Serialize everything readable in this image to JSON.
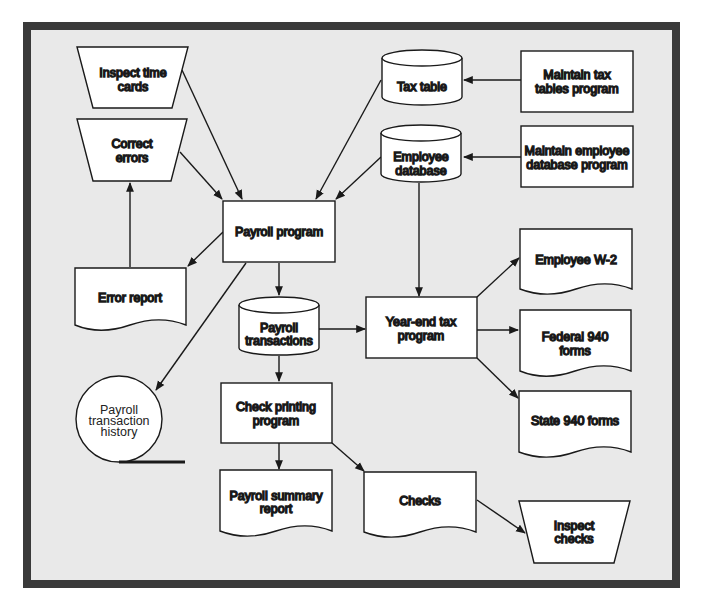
{
  "diagram": {
    "colors": {
      "frame": "#3a3a3a",
      "background": "#e9e9e9",
      "shape_fill": "#ffffff",
      "stroke": "#1a1a1a"
    },
    "nodes": [
      {
        "id": "inspect-time-cards",
        "type": "manual-operation",
        "lines": [
          "Inspect time",
          "cards"
        ]
      },
      {
        "id": "correct-errors",
        "type": "manual-operation",
        "lines": [
          "Correct",
          "errors"
        ]
      },
      {
        "id": "tax-table",
        "type": "database",
        "lines": [
          "Tax table"
        ]
      },
      {
        "id": "maintain-tax-tables-program",
        "type": "process",
        "lines": [
          "Maintain tax",
          "tables program"
        ]
      },
      {
        "id": "employee-database",
        "type": "database",
        "lines": [
          "Employee",
          "database"
        ]
      },
      {
        "id": "maintain-employee-database-program",
        "type": "process",
        "lines": [
          "Maintain employee",
          "database program"
        ]
      },
      {
        "id": "payroll-program",
        "type": "process",
        "lines": [
          "Payroll program"
        ]
      },
      {
        "id": "error-report",
        "type": "document",
        "lines": [
          "Error report"
        ]
      },
      {
        "id": "payroll-transactions",
        "type": "database",
        "lines": [
          "Payroll",
          "transactions"
        ]
      },
      {
        "id": "year-end-tax-program",
        "type": "process",
        "lines": [
          "Year-end tax",
          "program"
        ]
      },
      {
        "id": "employee-w2",
        "type": "document",
        "lines": [
          "Employee W-2"
        ]
      },
      {
        "id": "federal-940-forms",
        "type": "document",
        "lines": [
          "Federal 940",
          "forms"
        ]
      },
      {
        "id": "state-940-forms",
        "type": "document",
        "lines": [
          "State 940 forms"
        ]
      },
      {
        "id": "payroll-transaction-history",
        "type": "sequential-storage",
        "lines": [
          "Payroll",
          "transaction",
          "history"
        ]
      },
      {
        "id": "check-printing-program",
        "type": "process",
        "lines": [
          "Check printing",
          "program"
        ]
      },
      {
        "id": "payroll-summary-report",
        "type": "document",
        "lines": [
          "Payroll summary",
          "report"
        ]
      },
      {
        "id": "checks",
        "type": "document",
        "lines": [
          "Checks"
        ]
      },
      {
        "id": "inspect-checks",
        "type": "manual-operation",
        "lines": [
          "Inspect",
          "checks"
        ]
      }
    ],
    "edges": [
      {
        "from": "inspect-time-cards",
        "to": "payroll-program"
      },
      {
        "from": "correct-errors",
        "to": "payroll-program"
      },
      {
        "from": "tax-table",
        "to": "payroll-program"
      },
      {
        "from": "employee-database",
        "to": "payroll-program"
      },
      {
        "from": "maintain-tax-tables-program",
        "to": "tax-table"
      },
      {
        "from": "maintain-employee-database-program",
        "to": "employee-database"
      },
      {
        "from": "error-report",
        "to": "correct-errors"
      },
      {
        "from": "payroll-program",
        "to": "error-report"
      },
      {
        "from": "payroll-program",
        "to": "payroll-transactions"
      },
      {
        "from": "payroll-program",
        "to": "payroll-transaction-history"
      },
      {
        "from": "employee-database",
        "to": "year-end-tax-program"
      },
      {
        "from": "payroll-transactions",
        "to": "year-end-tax-program"
      },
      {
        "from": "year-end-tax-program",
        "to": "employee-w2"
      },
      {
        "from": "year-end-tax-program",
        "to": "federal-940-forms"
      },
      {
        "from": "year-end-tax-program",
        "to": "state-940-forms"
      },
      {
        "from": "payroll-transactions",
        "to": "check-printing-program"
      },
      {
        "from": "check-printing-program",
        "to": "payroll-summary-report"
      },
      {
        "from": "check-printing-program",
        "to": "checks"
      },
      {
        "from": "checks",
        "to": "inspect-checks"
      }
    ]
  }
}
